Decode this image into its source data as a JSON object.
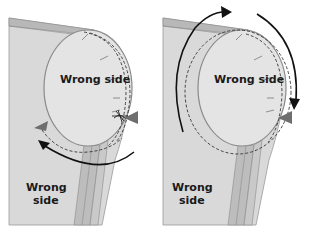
{
  "panels": [
    {
      "id": "left",
      "labels": {
        "inner": "Wrong side",
        "outer_line1": "Wrong",
        "outer_line2": "side"
      }
    },
    {
      "id": "right",
      "labels": {
        "inner": "Wrong side",
        "outer_line1": "Wrong",
        "outer_line2": "side"
      }
    }
  ],
  "colors": {
    "fabric": "#d9d9d9",
    "fabric_band": "#b8b8b8",
    "sleeve_strip": "#bdbdbd",
    "ellipse_fill": "#e4e4e4",
    "outline": "#8a8a8a",
    "stitch": "#333333",
    "arrow": "#111111",
    "marker": "#6e6e6e"
  }
}
